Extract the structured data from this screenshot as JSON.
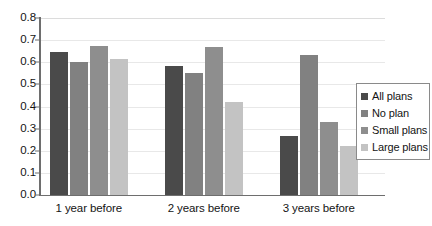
{
  "chart_data": {
    "type": "bar",
    "title": "",
    "subtitle": "",
    "xlabel": "",
    "ylabel": "",
    "categories": [
      "1 year before",
      "2 years before",
      "3 years before"
    ],
    "series": [
      {
        "name": "All plans",
        "color": "#4a4a4a",
        "values": [
          0.645,
          0.585,
          0.265
        ]
      },
      {
        "name": "No plan",
        "color": "#818181",
        "values": [
          0.6,
          0.55,
          0.635
        ]
      },
      {
        "name": "Small plans",
        "color": "#8e8e8e",
        "values": [
          0.675,
          0.67,
          0.33
        ]
      },
      {
        "name": "Large plans",
        "color": "#c3c3c3",
        "values": [
          0.615,
          0.42,
          0.22
        ]
      }
    ],
    "ylim": [
      0.0,
      0.8
    ],
    "ytick_step": 0.1,
    "ytick_labels": [
      "0.0",
      "0.1",
      "0.2",
      "0.3",
      "0.4",
      "0.5",
      "0.6",
      "0.7",
      "0.8"
    ],
    "ytick_values": [
      0.0,
      0.1,
      0.2,
      0.3,
      0.4,
      0.5,
      0.6,
      0.7,
      0.8
    ],
    "grid": true,
    "grid_axis": "y",
    "legend_position": "right",
    "background_color": "#ffffff",
    "axis_color": "#6e6e6e",
    "gridline_color": "#e8e8e8"
  }
}
